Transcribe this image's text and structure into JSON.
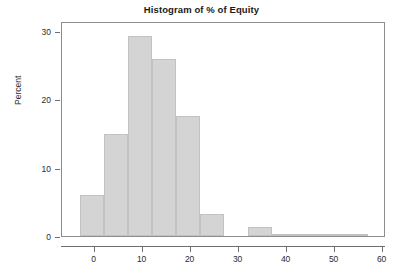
{
  "chart_data": {
    "type": "bar",
    "title": "Histogram of % of Equity",
    "xlabel": "",
    "ylabel": "Percent",
    "xlim": [
      -6.8,
      60.7
    ],
    "ylim": [
      0,
      31.5
    ],
    "grid": false,
    "legend": null,
    "bin_width": 5,
    "x_ticks": [
      0,
      10,
      20,
      30,
      40,
      50,
      60
    ],
    "x_tick_labels": [
      "0",
      "10",
      "20",
      "30",
      "40",
      "50",
      "60"
    ],
    "y_ticks": [
      0,
      10,
      20,
      30
    ],
    "y_tick_labels": [
      "0",
      "10",
      "20",
      "30"
    ],
    "bar_color": "#d4d4d4",
    "bar_edge_color": "#c2c2c2",
    "bins": [
      {
        "x0": -3,
        "x1": 2,
        "value": 6.0
      },
      {
        "x0": 2,
        "x1": 7,
        "value": 15.0
      },
      {
        "x0": 7,
        "x1": 12,
        "value": 29.3
      },
      {
        "x0": 12,
        "x1": 17,
        "value": 26.0
      },
      {
        "x0": 17,
        "x1": 22,
        "value": 17.6
      },
      {
        "x0": 22,
        "x1": 27,
        "value": 3.2
      },
      {
        "x0": 27,
        "x1": 32,
        "value": 0.0
      },
      {
        "x0": 32,
        "x1": 37,
        "value": 1.3
      },
      {
        "x0": 37,
        "x1": 42,
        "value": 0.3
      },
      {
        "x0": 42,
        "x1": 47,
        "value": 0.3
      },
      {
        "x0": 47,
        "x1": 52,
        "value": 0.3
      },
      {
        "x0": 52,
        "x1": 57,
        "value": 0.2
      }
    ],
    "categories": [
      "-3 to 2",
      "2 to 7",
      "7 to 12",
      "12 to 17",
      "17 to 22",
      "22 to 27",
      "27 to 32",
      "32 to 37",
      "37 to 42",
      "42 to 47",
      "47 to 52",
      "52 to 57"
    ],
    "values": [
      6.0,
      15.0,
      29.3,
      26.0,
      17.6,
      3.2,
      0.0,
      1.3,
      0.3,
      0.3,
      0.3,
      0.2
    ]
  }
}
